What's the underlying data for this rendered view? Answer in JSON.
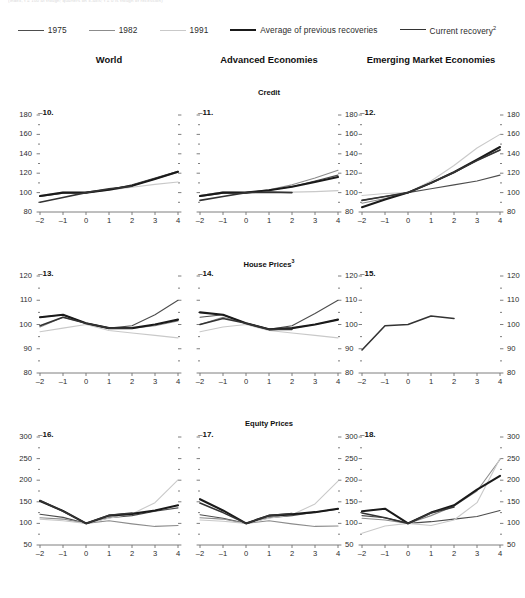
{
  "topnote": "(Index, t = 100 at trough; quarters on x-axis; t = 0 is trough of recession)",
  "legend": [
    {
      "label": "1975",
      "color": "#4d4d4d",
      "width": 1.1
    },
    {
      "label": "1982",
      "color": "#8c8c8c",
      "width": 1.1
    },
    {
      "label": "1991",
      "color": "#c9c9c9",
      "width": 1.1
    },
    {
      "label": "Average of previous recoveries",
      "color": "#1a1a1a",
      "width": 2.1
    },
    {
      "label": "Current recovery",
      "sup": "2",
      "color": "#333333",
      "width": 1.5
    }
  ],
  "columns": [
    {
      "label": "World"
    },
    {
      "label": "Advanced Economies"
    },
    {
      "label": "Emerging Market Economies"
    }
  ],
  "rows": [
    {
      "title": "Credit",
      "sup": ""
    },
    {
      "title": "House Prices",
      "sup": "3"
    },
    {
      "title": "Equity Prices",
      "sup": ""
    }
  ],
  "xticks": [
    "-2",
    "-1",
    "0",
    "1",
    "2",
    "3",
    "4"
  ],
  "chart_data": [
    {
      "type": "line",
      "panel": "10.",
      "title": "Credit",
      "column": "World",
      "xlabel": "",
      "ylabel": "",
      "x": [
        -2,
        -1,
        0,
        1,
        2,
        3,
        4
      ],
      "xlim": [
        -2,
        4
      ],
      "ylim": [
        80,
        180
      ],
      "yticks": [
        80,
        100,
        120,
        140,
        160,
        180
      ],
      "yticks_left": [
        80,
        100,
        120,
        140,
        160,
        180
      ],
      "yticks_right": [],
      "grid": false,
      "series": [
        {
          "name": "1975",
          "color": "#4d4d4d",
          "width": 1.1,
          "values": [
            96,
            99.5,
            100,
            103,
            108,
            115,
            122
          ]
        },
        {
          "name": "1982",
          "color": "#8c8c8c",
          "width": 1.1,
          "values": [
            96.5,
            100,
            100,
            103,
            107,
            114,
            121
          ]
        },
        {
          "name": "1991",
          "color": "#c9c9c9",
          "width": 1.1,
          "values": [
            97,
            100.5,
            100,
            102.5,
            105.5,
            108.5,
            111
          ]
        },
        {
          "name": "Average of previous recoveries",
          "color": "#1a1a1a",
          "width": 2.1,
          "values": [
            96.5,
            100,
            100,
            103,
            107,
            114,
            121.5
          ]
        },
        {
          "name": "Current recovery",
          "color": "#333333",
          "width": 1.6,
          "values": [
            90,
            95,
            100,
            104,
            106.5,
            null,
            null
          ]
        }
      ]
    },
    {
      "type": "line",
      "panel": "11.",
      "title": "Credit",
      "column": "Advanced Economies",
      "x": [
        -2,
        -1,
        0,
        1,
        2,
        3,
        4
      ],
      "xlim": [
        -2,
        4
      ],
      "ylim": [
        80,
        180
      ],
      "yticks_left": [],
      "yticks_right": [
        80,
        100,
        120,
        140,
        160,
        180
      ],
      "grid": false,
      "series": [
        {
          "name": "1975",
          "color": "#4d4d4d",
          "width": 1.1,
          "values": [
            96,
            99.5,
            100,
            102.5,
            106,
            112,
            118
          ]
        },
        {
          "name": "1982",
          "color": "#8c8c8c",
          "width": 1.1,
          "values": [
            97,
            100.5,
            100,
            103,
            108,
            115,
            123
          ]
        },
        {
          "name": "1991",
          "color": "#c9c9c9",
          "width": 1.1,
          "values": [
            97,
            100.5,
            100,
            101,
            100.5,
            101,
            102
          ]
        },
        {
          "name": "Average of previous recoveries",
          "color": "#1a1a1a",
          "width": 2.1,
          "values": [
            96.5,
            100,
            100,
            102.5,
            106,
            111,
            116
          ]
        },
        {
          "name": "Current recovery",
          "color": "#333333",
          "width": 1.6,
          "values": [
            92,
            96,
            100,
            100.5,
            100,
            null,
            null
          ]
        }
      ]
    },
    {
      "type": "line",
      "panel": "12.",
      "title": "Credit",
      "column": "Emerging Market Economies",
      "x": [
        -2,
        -1,
        0,
        1,
        2,
        3,
        4
      ],
      "xlim": [
        -2,
        4
      ],
      "ylim": [
        80,
        180
      ],
      "yticks_left": [],
      "yticks_right": [
        80,
        100,
        120,
        140,
        160,
        180
      ],
      "grid": false,
      "series": [
        {
          "name": "1975",
          "color": "#4d4d4d",
          "width": 1.1,
          "values": [
            92,
            96,
            100,
            104,
            108,
            112,
            118
          ]
        },
        {
          "name": "1982",
          "color": "#8c8c8c",
          "width": 1.1,
          "values": [
            89,
            94,
            100,
            110,
            121,
            133,
            144
          ]
        },
        {
          "name": "1991",
          "color": "#c9c9c9",
          "width": 1.1,
          "values": [
            97,
            99,
            100,
            112,
            128,
            146,
            160
          ]
        },
        {
          "name": "Average of previous recoveries",
          "color": "#1a1a1a",
          "width": 2.1,
          "values": [
            85,
            93,
            100,
            110,
            121,
            134,
            147
          ]
        },
        {
          "name": "Current recovery",
          "color": "#333333",
          "width": 1.6,
          "values": [
            92,
            96,
            100,
            110,
            121,
            133,
            144
          ]
        }
      ]
    },
    {
      "type": "line",
      "panel": "13.",
      "title": "House Prices",
      "column": "World",
      "x": [
        -2,
        -1,
        0,
        1,
        2,
        3,
        4
      ],
      "xlim": [
        -2,
        4
      ],
      "ylim": [
        80,
        120
      ],
      "yticks_left": [
        80,
        90,
        100,
        110,
        120
      ],
      "yticks_right": [],
      "grid": false,
      "series": [
        {
          "name": "1975",
          "color": "#4d4d4d",
          "width": 1.1,
          "values": [
            103,
            104,
            100.5,
            98.5,
            99.5,
            104,
            110
          ]
        },
        {
          "name": "1982",
          "color": "#8c8c8c",
          "width": 1.1,
          "values": [
            99,
            103,
            100.5,
            98.5,
            98.5,
            99.5,
            101.5
          ]
        },
        {
          "name": "1991",
          "color": "#c9c9c9",
          "width": 1.1,
          "values": [
            97,
            98.5,
            100,
            97.5,
            96.5,
            95.5,
            94.5
          ]
        },
        {
          "name": "Average of previous recoveries",
          "color": "#1a1a1a",
          "width": 2.1,
          "values": [
            103,
            104,
            100.5,
            98.5,
            98.5,
            100,
            102
          ]
        },
        {
          "name": "Current recovery",
          "color": "#333333",
          "width": 1.6,
          "values": [
            99.5,
            103,
            100.5,
            98.5,
            98.5,
            null,
            null
          ]
        }
      ]
    },
    {
      "type": "line",
      "panel": "14.",
      "title": "House Prices",
      "column": "Advanced Economies",
      "x": [
        -2,
        -1,
        0,
        1,
        2,
        3,
        4
      ],
      "xlim": [
        -2,
        4
      ],
      "ylim": [
        80,
        120
      ],
      "yticks_left": [],
      "yticks_right": [
        80,
        90,
        100,
        110,
        120
      ],
      "grid": false,
      "series": [
        {
          "name": "1975",
          "color": "#4d4d4d",
          "width": 1.1,
          "values": [
            103,
            104,
            100.5,
            98,
            99.5,
            104.5,
            110
          ]
        },
        {
          "name": "1982",
          "color": "#8c8c8c",
          "width": 1.1,
          "values": [
            100,
            103,
            100.5,
            98,
            98.5,
            100,
            102
          ]
        },
        {
          "name": "1991",
          "color": "#c9c9c9",
          "width": 1.1,
          "values": [
            97,
            99,
            100,
            97.5,
            96.5,
            95.5,
            94.5
          ]
        },
        {
          "name": "Average of previous recoveries",
          "color": "#1a1a1a",
          "width": 2.1,
          "values": [
            105,
            104,
            100.5,
            98,
            98.5,
            100,
            102
          ]
        },
        {
          "name": "Current recovery",
          "color": "#333333",
          "width": 1.6,
          "values": [
            100,
            102.5,
            100.5,
            98,
            98,
            null,
            null
          ]
        }
      ]
    },
    {
      "type": "line",
      "panel": "15.",
      "title": "House Prices",
      "column": "Emerging Market Economies",
      "x": [
        -2,
        -1,
        0,
        1,
        2,
        3,
        4
      ],
      "xlim": [
        -2,
        4
      ],
      "ylim": [
        80,
        120
      ],
      "yticks_left": [],
      "yticks_right": [
        80,
        90,
        100,
        110,
        120
      ],
      "grid": false,
      "series": [
        {
          "name": "Current recovery",
          "color": "#333333",
          "width": 1.6,
          "values": [
            89.5,
            99.5,
            100,
            103.5,
            102.5,
            null,
            null
          ]
        }
      ]
    },
    {
      "type": "line",
      "panel": "16.",
      "title": "Equity Prices",
      "column": "World",
      "x": [
        -2,
        -1,
        0,
        1,
        2,
        3,
        4
      ],
      "xlim": [
        -2,
        4
      ],
      "ylim": [
        50,
        300
      ],
      "yticks_left": [
        50,
        100,
        150,
        200,
        250,
        300
      ],
      "yticks_right": [],
      "grid": false,
      "series": [
        {
          "name": "1975",
          "color": "#4d4d4d",
          "width": 1.1,
          "values": [
            121,
            114,
            100,
            113,
            118,
            128,
            136
          ]
        },
        {
          "name": "1982",
          "color": "#8c8c8c",
          "width": 1.1,
          "values": [
            113,
            110,
            100,
            106,
            99,
            93,
            95
          ]
        },
        {
          "name": "1991",
          "color": "#c9c9c9",
          "width": 1.1,
          "values": [
            110,
            106,
            100,
            112,
            122,
            148,
            201
          ]
        },
        {
          "name": "Average of previous recoveries",
          "color": "#1a1a1a",
          "width": 2.1,
          "values": [
            152,
            129,
            100,
            118,
            122,
            130,
            142
          ]
        },
        {
          "name": "Current recovery",
          "color": "#333333",
          "width": 1.6,
          "values": [
            153,
            128,
            100,
            119,
            124,
            null,
            null
          ]
        }
      ]
    },
    {
      "type": "line",
      "panel": "17.",
      "title": "Equity Prices",
      "column": "Advanced Economies",
      "x": [
        -2,
        -1,
        0,
        1,
        2,
        3,
        4
      ],
      "xlim": [
        -2,
        4
      ],
      "ylim": [
        50,
        300
      ],
      "yticks_left": [],
      "yticks_right": [
        50,
        100,
        150,
        200,
        250,
        300
      ],
      "grid": false,
      "series": [
        {
          "name": "1975",
          "color": "#4d4d4d",
          "width": 1.1,
          "values": [
            120,
            112,
            100,
            113,
            118,
            126,
            133
          ]
        },
        {
          "name": "1982",
          "color": "#8c8c8c",
          "width": 1.1,
          "values": [
            113,
            110,
            100,
            106,
            99,
            93,
            94
          ]
        },
        {
          "name": "1991",
          "color": "#c9c9c9",
          "width": 1.1,
          "values": [
            108,
            105,
            100,
            112,
            120,
            145,
            198
          ]
        },
        {
          "name": "Average of previous recoveries",
          "color": "#1a1a1a",
          "width": 2.1,
          "values": [
            156,
            130,
            100,
            118,
            121,
            126,
            134
          ]
        },
        {
          "name": "Current recovery",
          "color": "#333333",
          "width": 1.6,
          "values": [
            147,
            125,
            100,
            118,
            123,
            null,
            null
          ]
        }
      ]
    },
    {
      "type": "line",
      "panel": "18.",
      "title": "Equity Prices",
      "column": "Emerging Market Economies",
      "x": [
        -2,
        -1,
        0,
        1,
        2,
        3,
        4
      ],
      "xlim": [
        50,
        300
      ],
      "ylim": [
        50,
        300
      ],
      "yticks_left": [],
      "yticks_right": [
        50,
        100,
        150,
        200,
        250,
        300
      ],
      "grid": false,
      "series": [
        {
          "name": "1975",
          "color": "#4d4d4d",
          "width": 1.1,
          "values": [
            118,
            113,
            100,
            104,
            110,
            116,
            130
          ]
        },
        {
          "name": "1982",
          "color": "#8c8c8c",
          "width": 1.1,
          "values": [
            112,
            108,
            100,
            118,
            140,
            175,
            248
          ]
        },
        {
          "name": "1991",
          "color": "#c9c9c9",
          "width": 1.1,
          "values": [
            77,
            94,
            100,
            95,
            108,
            148,
            250
          ]
        },
        {
          "name": "Average of previous recoveries",
          "color": "#1a1a1a",
          "width": 2.1,
          "values": [
            128,
            134,
            100,
            125,
            142,
            178,
            210
          ]
        },
        {
          "name": "Current recovery",
          "color": "#333333",
          "width": 1.6,
          "values": [
            124,
            113,
            100,
            124,
            138,
            null,
            null
          ]
        }
      ]
    }
  ]
}
